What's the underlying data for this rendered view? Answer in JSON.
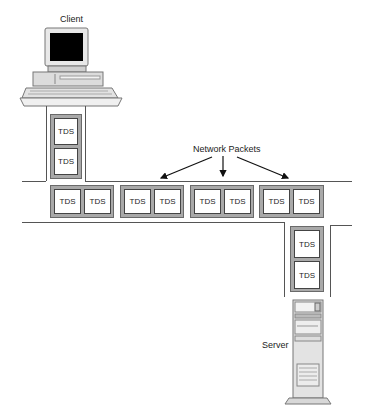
{
  "diagram": {
    "client_label": "Client",
    "server_label": "Server",
    "network_label": "Network Packets",
    "unit_label": "TDS",
    "colors": {
      "packet_fill": "#a9a9a9",
      "cell_fill": "#ffffff",
      "line": "#555555",
      "screen": "#000000"
    },
    "client_packet": {
      "cells": [
        "TDS",
        "TDS"
      ]
    },
    "horizontal_packets": [
      {
        "cells": [
          "TDS",
          "TDS"
        ]
      },
      {
        "cells": [
          "TDS",
          "TDS"
        ]
      },
      {
        "cells": [
          "TDS",
          "TDS"
        ]
      },
      {
        "cells": [
          "TDS",
          "TDS"
        ]
      }
    ],
    "server_packet": {
      "cells": [
        "TDS",
        "TDS"
      ]
    },
    "arrows": [
      "to-packet-2",
      "to-packet-3",
      "to-packet-4"
    ]
  }
}
